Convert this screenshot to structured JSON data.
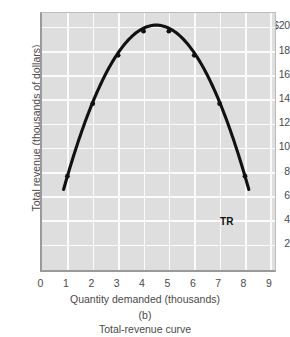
{
  "chart_data": {
    "type": "line",
    "title": "Total-revenue curve",
    "panel_letter": "(b)",
    "xlabel": "Quantity demanded (thousands)",
    "ylabel": "Total revenue (thousands of dollars)",
    "xlim": [
      0,
      9.3
    ],
    "ylim": [
      0,
      21.5
    ],
    "grid": true,
    "legend": "none",
    "series_label": "TR",
    "x_ticks": [
      "0",
      "1",
      "2",
      "3",
      "4",
      "5",
      "6",
      "7",
      "8",
      "9"
    ],
    "x_tick_values": [
      0,
      1,
      2,
      3,
      4,
      5,
      6,
      7,
      8,
      9
    ],
    "y_ticks": [
      "2",
      "4",
      "6",
      "8",
      "10",
      "12",
      "14",
      "16",
      "18",
      "$20"
    ],
    "y_tick_values": [
      2,
      4,
      6,
      8,
      10,
      12,
      14,
      16,
      18,
      20
    ],
    "x": [
      1,
      2,
      3,
      4,
      5,
      6,
      7,
      8
    ],
    "values": [
      8,
      14,
      18,
      20,
      20,
      18,
      14,
      8
    ],
    "curve_start": {
      "x": 0.85,
      "y": 5.0
    },
    "curve_end": {
      "x": 8.15,
      "y": 5.0
    },
    "peak": {
      "x": 4.5,
      "y": 20.5
    },
    "annotations": [
      {
        "text": "TR",
        "x": 8.05,
        "y": 6.2
      }
    ],
    "colors": {
      "plot_background": "#dedede",
      "gridline": "#fbfbfb",
      "curve": "#111111",
      "axis": "#9a9a9a",
      "text": "#4a4a4a"
    }
  }
}
